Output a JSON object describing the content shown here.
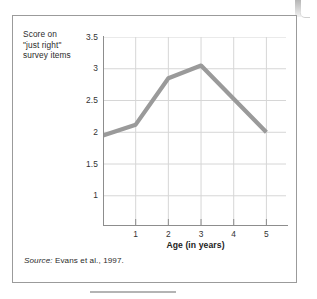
{
  "figure": {
    "y_axis_title": "Score on\n\"just right\"\nsurvey items",
    "x_axis_title": "Age (in years)",
    "source_label": "Source:",
    "source_text": " Evans et al., 1997."
  },
  "chart_data": {
    "type": "line",
    "title": "",
    "xlabel": "Age (in years)",
    "ylabel": "Score on \"just right\" survey items",
    "x": [
      0,
      1,
      2,
      3,
      5
    ],
    "values": [
      1.95,
      2.12,
      2.85,
      3.05,
      2.0
    ],
    "series": [
      {
        "name": "Score on \"just right\" survey items",
        "x": [
          0,
          1,
          2,
          3,
          5
        ],
        "values": [
          1.95,
          2.12,
          2.85,
          3.05,
          2.0
        ]
      }
    ],
    "xlim": [
      0,
      5.6
    ],
    "ylim": [
      0.5,
      3.7
    ],
    "xticks": [
      "1",
      "2",
      "3",
      "4",
      "5"
    ],
    "xtick_values": [
      1,
      2,
      3,
      4,
      5
    ],
    "yticks": [
      "1",
      "1.5",
      "2",
      "2.5",
      "3",
      "3.5"
    ],
    "ytick_values": [
      1,
      1.5,
      2,
      2.5,
      3,
      3.5
    ],
    "grid": true,
    "legend": "none",
    "line_color": "#9a9a9a",
    "grid_color": "#d6d6d6",
    "axis_color": "#8d8d8d",
    "source": "Source: Evans et al., 1997."
  }
}
